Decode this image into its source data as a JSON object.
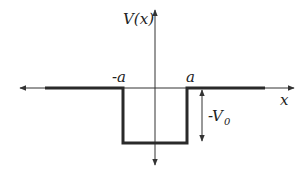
{
  "diagram": {
    "labels": {
      "y_axis": "V(x)",
      "x_axis": "x",
      "left_edge": "-a",
      "right_edge": "a",
      "depth": "-V",
      "depth_subscript": "0"
    },
    "colors": {
      "axis": "#333333",
      "potential": "#2a2a2a",
      "background": "#ffffff"
    }
  }
}
